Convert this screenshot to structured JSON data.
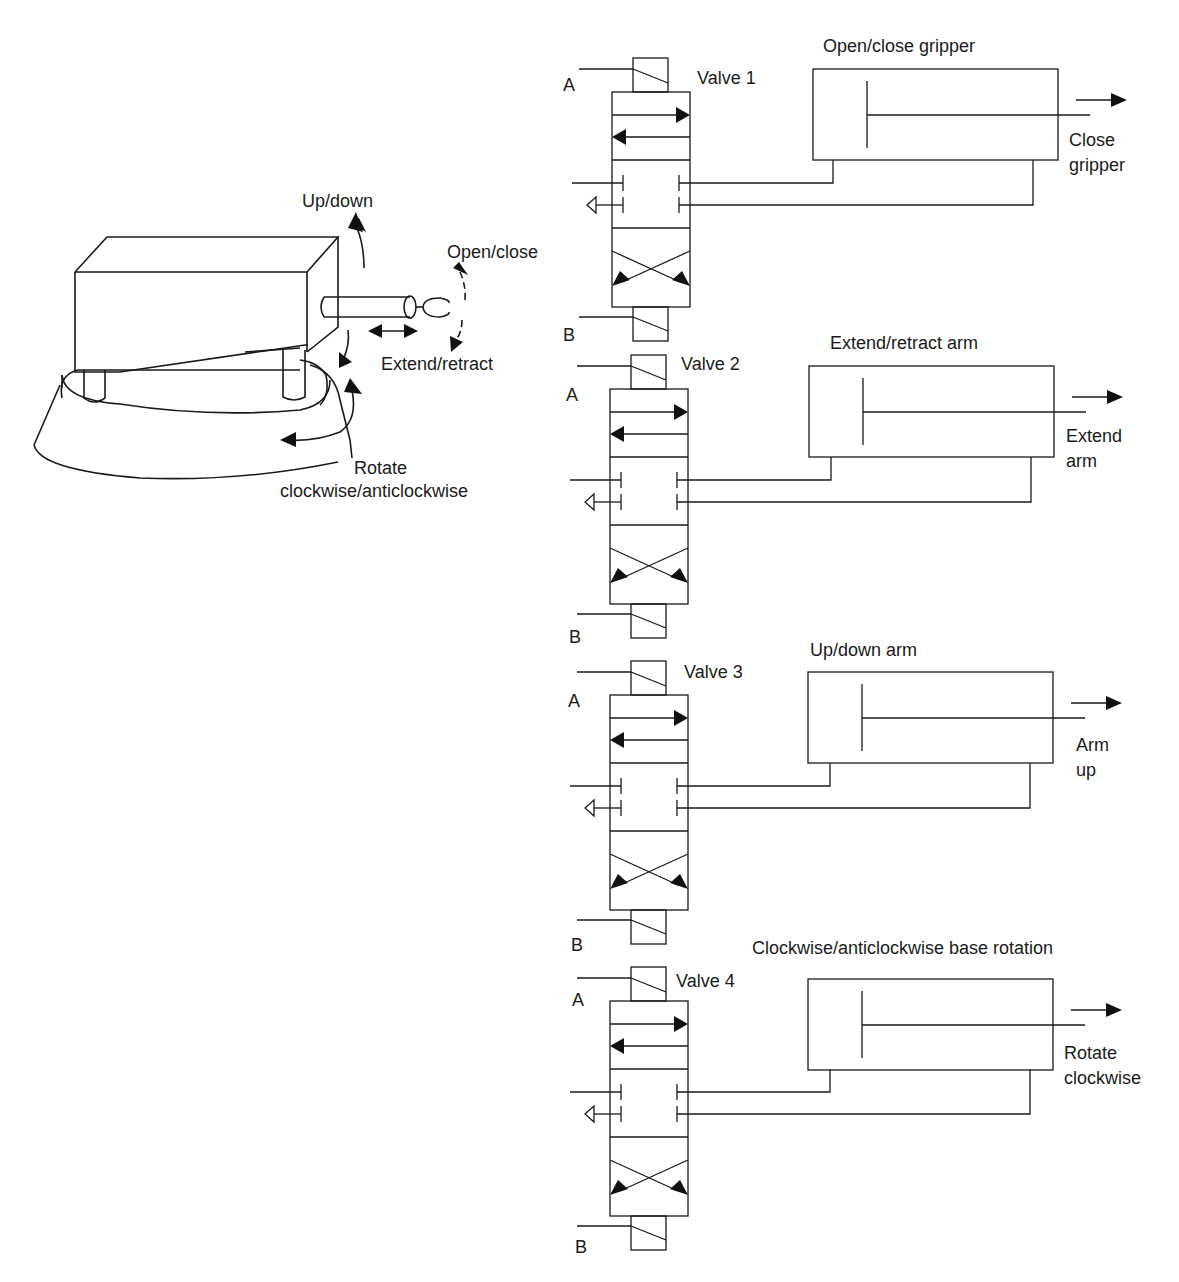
{
  "robot": {
    "labels": {
      "up_down": "Up/down",
      "open_close": "Open/close",
      "extend_retract": "Extend/retract",
      "rotate_line1": "Rotate",
      "rotate_line2": "clockwise/anticlockwise"
    }
  },
  "valves": [
    {
      "name": "Valve 1",
      "port_a": "A",
      "port_b": "B",
      "cylinder_title": "Open/close gripper",
      "action_line1": "Close",
      "action_line2": "gripper"
    },
    {
      "name": "Valve 2",
      "port_a": "A",
      "port_b": "B",
      "cylinder_title": "Extend/retract arm",
      "action_line1": "Extend",
      "action_line2": "arm"
    },
    {
      "name": "Valve 3",
      "port_a": "A",
      "port_b": "B",
      "cylinder_title": "Up/down arm",
      "action_line1": "Arm",
      "action_line2": "up"
    },
    {
      "name": "Valve 4",
      "port_a": "A",
      "port_b": "B",
      "cylinder_title": "Clockwise/anticlockwise base rotation",
      "action_line1": "Rotate",
      "action_line2": "clockwise"
    }
  ]
}
